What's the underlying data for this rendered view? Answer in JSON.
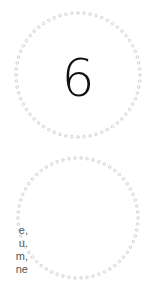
{
  "page": {
    "number": "6",
    "text_line_endings": [
      "e,",
      "u.",
      "m,",
      "ne"
    ]
  },
  "ornament": {
    "shape": "figure-eight dotted outline",
    "dot_color": "#c8c8c8",
    "upper_circle": {
      "cx": 78,
      "cy": 75,
      "r": 62
    },
    "lower_circle": {
      "cx": 78,
      "cy": 218,
      "r": 60
    }
  },
  "colors": {
    "number": "#111111",
    "text": "#555555",
    "background": "#ffffff"
  }
}
